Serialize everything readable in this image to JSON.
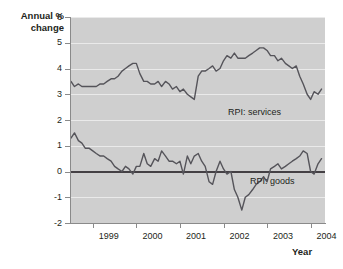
{
  "chart_data": {
    "type": "line",
    "title": "",
    "ylabel": "Annual %\nchange",
    "xlabel": "Year",
    "ylim": [
      -2,
      6
    ],
    "yticks": [
      6,
      5,
      4,
      3,
      2,
      1,
      0,
      -1,
      -2
    ],
    "xlim": [
      1998.5,
      2004.33
    ],
    "xticks": [
      1999,
      2000,
      2001,
      2002,
      2003,
      2004
    ],
    "xticklabels": [
      "1999",
      "2000",
      "2001",
      "2002",
      "2003",
      "2004"
    ],
    "grid": "horizontal",
    "zero_line": 0,
    "legend": "inline-annotation",
    "plot_background": "#cfcfcf",
    "gridline_color": "#eaeaea",
    "line_color": "#55545a",
    "series": [
      {
        "name": "RPI: services",
        "label": "RPI: services",
        "x": [
          1998.5,
          1998.58,
          1998.67,
          1998.75,
          1998.83,
          1998.92,
          1999.0,
          1999.08,
          1999.17,
          1999.25,
          1999.33,
          1999.42,
          1999.5,
          1999.58,
          1999.67,
          1999.75,
          1999.83,
          1999.92,
          2000.0,
          2000.08,
          2000.17,
          2000.25,
          2000.33,
          2000.42,
          2000.5,
          2000.58,
          2000.67,
          2000.75,
          2000.83,
          2000.92,
          2001.0,
          2001.08,
          2001.17,
          2001.25,
          2001.33,
          2001.42,
          2001.5,
          2001.58,
          2001.67,
          2001.75,
          2001.83,
          2001.92,
          2002.0,
          2002.08,
          2002.17,
          2002.25,
          2002.33,
          2002.42,
          2002.5,
          2002.58,
          2002.67,
          2002.75,
          2002.83,
          2002.92,
          2003.0,
          2003.08,
          2003.17,
          2003.25,
          2003.33,
          2003.42,
          2003.5,
          2003.58,
          2003.67,
          2003.75,
          2003.83,
          2003.92,
          2004.0,
          2004.08,
          2004.17,
          2004.25
        ],
        "values": [
          3.5,
          3.3,
          3.4,
          3.3,
          3.3,
          3.3,
          3.3,
          3.3,
          3.4,
          3.4,
          3.5,
          3.6,
          3.6,
          3.7,
          3.9,
          4.0,
          4.1,
          4.2,
          4.2,
          3.8,
          3.5,
          3.5,
          3.4,
          3.4,
          3.5,
          3.3,
          3.5,
          3.4,
          3.2,
          3.3,
          3.1,
          3.2,
          3.0,
          2.9,
          2.8,
          3.7,
          3.9,
          3.9,
          4.0,
          4.1,
          3.9,
          4.0,
          4.3,
          4.5,
          4.4,
          4.6,
          4.4,
          4.4,
          4.4,
          4.5,
          4.6,
          4.7,
          4.8,
          4.8,
          4.7,
          4.5,
          4.5,
          4.3,
          4.4,
          4.2,
          4.1,
          4.0,
          4.1,
          3.7,
          3.4,
          3.0,
          2.8,
          3.1,
          3.0,
          3.2
        ]
      },
      {
        "name": "RPI: goods",
        "label": "RPI: goods",
        "x": [
          1998.5,
          1998.58,
          1998.67,
          1998.75,
          1998.83,
          1998.92,
          1999.0,
          1999.08,
          1999.17,
          1999.25,
          1999.33,
          1999.42,
          1999.5,
          1999.58,
          1999.67,
          1999.75,
          1999.83,
          1999.92,
          2000.0,
          2000.08,
          2000.17,
          2000.25,
          2000.33,
          2000.42,
          2000.5,
          2000.58,
          2000.67,
          2000.75,
          2000.83,
          2000.92,
          2001.0,
          2001.08,
          2001.17,
          2001.25,
          2001.33,
          2001.42,
          2001.5,
          2001.58,
          2001.67,
          2001.75,
          2001.83,
          2001.92,
          2002.0,
          2002.08,
          2002.17,
          2002.25,
          2002.33,
          2002.42,
          2002.5,
          2002.58,
          2002.67,
          2002.75,
          2002.83,
          2002.92,
          2003.0,
          2003.08,
          2003.17,
          2003.25,
          2003.33,
          2003.42,
          2003.5,
          2003.58,
          2003.67,
          2003.75,
          2003.83,
          2003.92,
          2004.0,
          2004.08,
          2004.17,
          2004.25
        ],
        "values": [
          1.3,
          1.5,
          1.2,
          1.1,
          0.9,
          0.9,
          0.8,
          0.7,
          0.6,
          0.6,
          0.5,
          0.4,
          0.2,
          0.1,
          0.0,
          0.2,
          0.1,
          -0.1,
          0.2,
          0.2,
          0.7,
          0.3,
          0.2,
          0.5,
          0.4,
          0.8,
          0.6,
          0.4,
          0.4,
          0.3,
          0.4,
          -0.1,
          0.6,
          0.3,
          0.6,
          0.7,
          0.4,
          0.2,
          -0.4,
          -0.5,
          0.0,
          0.4,
          0.1,
          -0.1,
          0.0,
          -0.7,
          -1.0,
          -1.5,
          -1.0,
          -0.9,
          -0.7,
          -0.5,
          -0.4,
          -0.2,
          -0.4,
          0.1,
          0.2,
          0.3,
          0.1,
          0.2,
          0.3,
          0.4,
          0.5,
          0.6,
          0.8,
          0.7,
          0.0,
          -0.1,
          0.3,
          0.5
        ]
      }
    ]
  },
  "annotations": {
    "services_label": "RPI: services",
    "goods_label": "RPI: goods"
  }
}
